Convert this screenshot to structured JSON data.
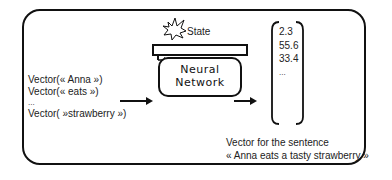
{
  "diagram": {
    "inputs": [
      "Vector(« Anna »)",
      "Vector(« eats »)",
      "...",
      "Vector( »strawberry »)"
    ],
    "state_label": "State",
    "neural_network_label": [
      "Neural",
      "Network"
    ],
    "output_values": [
      "2.3",
      "55.6",
      "33.4",
      "..."
    ],
    "caption_line1": "Vector for the sentence",
    "caption_line2": "« Anna eats a tasty strawberry »",
    "colors": {
      "stroke": "#111111",
      "text": "#222222",
      "background": "#ffffff"
    }
  }
}
